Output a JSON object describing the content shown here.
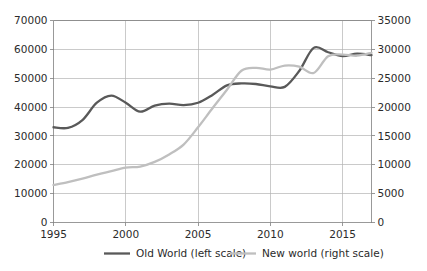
{
  "chart_data": {
    "type": "line",
    "title": "",
    "subtitle": "",
    "xlabel": "",
    "ylabel": "",
    "grid": true,
    "legend_position": "bottom",
    "x": [
      1995,
      1996,
      1997,
      1998,
      1999,
      2000,
      2001,
      2002,
      2003,
      2004,
      2005,
      2006,
      2007,
      2008,
      2009,
      2010,
      2011,
      2012,
      2013,
      2014,
      2015,
      2016,
      2017
    ],
    "x_tick_labels": [
      "1995",
      "2000",
      "2005",
      "2010",
      "2015"
    ],
    "x_tick_values": [
      1995,
      2000,
      2005,
      2010,
      2015
    ],
    "xlim": [
      1995,
      2017
    ],
    "axes": [
      {
        "id": "left",
        "label": "",
        "ylim": [
          0,
          70000
        ],
        "ticks": [
          0,
          10000,
          20000,
          30000,
          40000,
          50000,
          60000,
          70000
        ],
        "tick_labels": [
          "0",
          "10000",
          "20000",
          "30000",
          "40000",
          "50000",
          "60000",
          "70000"
        ]
      },
      {
        "id": "right",
        "label": "",
        "ylim": [
          0,
          35000
        ],
        "ticks": [
          0,
          5000,
          10000,
          15000,
          20000,
          25000,
          30000,
          35000
        ],
        "tick_labels": [
          "0",
          "5000",
          "10000",
          "15000",
          "20000",
          "25000",
          "30000",
          "35000"
        ]
      }
    ],
    "series": [
      {
        "name": "Old World (left scale)",
        "axis": "left",
        "color": "#595959",
        "values": [
          33000,
          32800,
          35500,
          41500,
          44000,
          41500,
          38400,
          40500,
          41200,
          40700,
          41500,
          44200,
          47500,
          48200,
          48000,
          47200,
          47000,
          52500,
          60500,
          59000,
          57700,
          58500,
          58000
        ]
      },
      {
        "name": "New world (right scale)",
        "axis": "right",
        "color": "#bfbfbf",
        "values": [
          6500,
          7000,
          7600,
          8300,
          8900,
          9500,
          9700,
          10500,
          11800,
          13500,
          16500,
          19800,
          23000,
          26300,
          26800,
          26500,
          27200,
          27000,
          25900,
          28800,
          29100,
          28900,
          29400
        ]
      }
    ],
    "series_right_tail": {
      "old_world_tail": [
        59500,
        58800,
        58500,
        59200,
        59000,
        59500,
        59200
      ],
      "new_world_tail": [
        29600,
        29300,
        29700,
        29900,
        30100,
        30300,
        30200
      ]
    }
  },
  "legend": {
    "items": [
      {
        "label": "Old World (left scale)",
        "color": "#595959"
      },
      {
        "label": "New world (right scale)",
        "color": "#bfbfbf"
      }
    ]
  },
  "colors": {
    "old_world": "#595959",
    "new_world": "#bfbfbf",
    "gridline": "#b3b3b3",
    "axis": "#808080",
    "text": "#2b2b2b",
    "background": "#ffffff"
  }
}
